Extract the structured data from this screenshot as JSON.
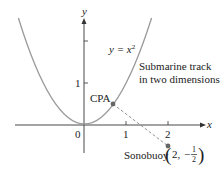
{
  "diagram": {
    "axes": {
      "x_label": "x",
      "y_label": "y",
      "origin_label": "0",
      "x_ticks": [
        "1",
        "2"
      ],
      "y_ticks": [
        "1"
      ]
    },
    "curve": {
      "equation_lhs": "y = x",
      "equation_exp": "2",
      "description_line1": "Submarine track",
      "description_line2": "in two dimensions",
      "color": "#9a9a9a"
    },
    "points": {
      "cpa": {
        "label": "CPA"
      },
      "sonobuoy": {
        "label": "Sonobuoy",
        "coord_x": "2,",
        "coord_minus": "−",
        "frac_num": "1",
        "frac_den": "2"
      }
    },
    "colors": {
      "axis": "#333333",
      "curve": "#9a9a9a",
      "point": "#666666",
      "dashed": "#888888"
    }
  }
}
